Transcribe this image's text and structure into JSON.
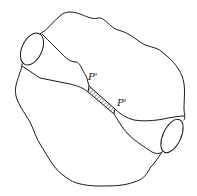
{
  "diagram": {
    "labels": {
      "upper_point": "P'",
      "lower_point": "P'"
    },
    "colors": {
      "line": "#1a1a1a",
      "background": "#ffffff",
      "hatch": "#555555"
    }
  }
}
